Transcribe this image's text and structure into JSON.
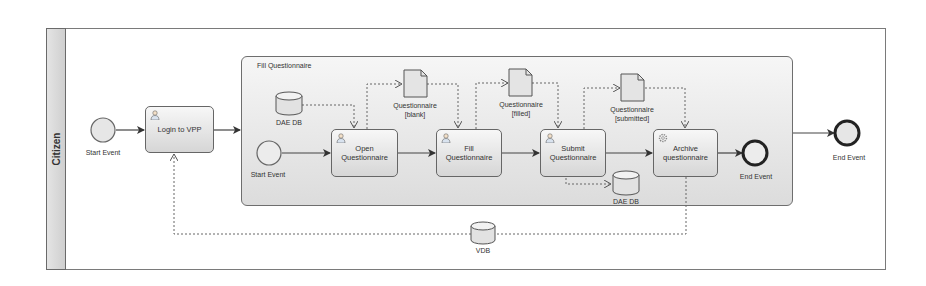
{
  "diagram": {
    "type": "BPMN process",
    "pool": {
      "lane_label": "Citizen"
    },
    "subprocess": {
      "title": "Fill Questionnaire"
    },
    "events": [
      {
        "id": "start_outer",
        "type": "start",
        "label": "Start Event"
      },
      {
        "id": "start_inner",
        "type": "start",
        "label": "Start Event"
      },
      {
        "id": "end_inner",
        "type": "end",
        "label": "End Event"
      },
      {
        "id": "end_outer",
        "type": "end",
        "label": "End Event"
      }
    ],
    "tasks": [
      {
        "id": "login",
        "label": "Login to VPP",
        "kind": "user"
      },
      {
        "id": "open",
        "label": "Open\nQuestionnaire",
        "kind": "user"
      },
      {
        "id": "fill",
        "label": "Fill\nQuestionnaire",
        "kind": "user"
      },
      {
        "id": "submit",
        "label": "Submit\nQuestionnaire",
        "kind": "user"
      },
      {
        "id": "archive",
        "label": "Archive\nquestionnaire",
        "kind": "service"
      }
    ],
    "data_objects": [
      {
        "id": "q_blank",
        "label": "Questionnaire\n[blank]"
      },
      {
        "id": "q_filled",
        "label": "Questionnaire\n[filled]"
      },
      {
        "id": "q_submitted",
        "label": "Questionnaire\n[submitted]"
      }
    ],
    "data_stores": [
      {
        "id": "dae_db_1",
        "label": "DAE DB"
      },
      {
        "id": "dae_db_2",
        "label": "DAE DB"
      },
      {
        "id": "vdb",
        "label": "VDB"
      }
    ],
    "sequence_flows": [
      [
        "start_outer",
        "login"
      ],
      [
        "login",
        "subprocess"
      ],
      [
        "start_inner",
        "open"
      ],
      [
        "open",
        "fill"
      ],
      [
        "fill",
        "submit"
      ],
      [
        "submit",
        "archive"
      ],
      [
        "archive",
        "end_inner"
      ],
      [
        "subprocess",
        "end_outer"
      ]
    ],
    "data_associations": [
      [
        "dae_db_1",
        "open"
      ],
      [
        "open",
        "q_blank"
      ],
      [
        "q_blank",
        "fill"
      ],
      [
        "fill",
        "q_filled"
      ],
      [
        "q_filled",
        "submit"
      ],
      [
        "submit",
        "q_submitted"
      ],
      [
        "q_submitted",
        "archive"
      ],
      [
        "submit",
        "dae_db_2"
      ],
      [
        "archive",
        "vdb"
      ],
      [
        "vdb",
        "login"
      ]
    ]
  }
}
